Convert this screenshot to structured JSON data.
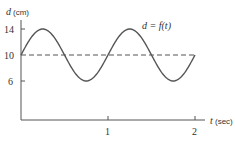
{
  "chart_data": {
    "type": "line",
    "title": "",
    "annotation": "d = f(t)",
    "xlabel": "t (sec)",
    "ylabel": "d (cm)",
    "xlim": [
      0,
      2
    ],
    "ylim": [
      0,
      15
    ],
    "x_ticks": [
      1,
      2
    ],
    "x_tick_labels": [
      "1",
      "2"
    ],
    "y_ticks": [
      6,
      10,
      14
    ],
    "y_tick_labels": [
      "6",
      "10",
      "14"
    ],
    "grid": false,
    "legend": null,
    "reference_line": {
      "y": 10,
      "style": "dashed"
    },
    "series": [
      {
        "name": "d = f(t)",
        "x": [
          0,
          0.125,
          0.25,
          0.375,
          0.5,
          0.625,
          0.75,
          0.875,
          1.0,
          1.125,
          1.25,
          1.375,
          1.5,
          1.625,
          1.75,
          1.875,
          2.0
        ],
        "values": [
          10,
          12.83,
          14,
          12.83,
          10,
          7.17,
          6,
          7.17,
          10,
          12.83,
          14,
          12.83,
          10,
          7.17,
          6,
          7.17,
          10
        ]
      }
    ]
  },
  "labels": {
    "y_axis": "d",
    "y_unit": "(cm)",
    "x_axis": "t",
    "x_unit": "(sec)",
    "curve": "d = f(t)",
    "y14": "14",
    "y10": "10",
    "y6": "6",
    "x1": "1",
    "x2": "2"
  }
}
